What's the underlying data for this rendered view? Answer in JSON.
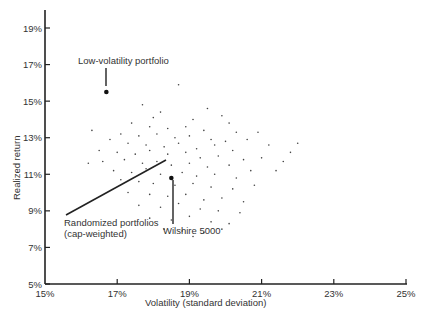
{
  "chart_data": {
    "type": "scatter",
    "title": "",
    "xlabel": "Volatility (standard deviation)",
    "ylabel": "Realized return",
    "xlim": [
      15,
      25
    ],
    "ylim": [
      5,
      20
    ],
    "x_ticks": [
      "15%",
      "17%",
      "19%",
      "21%",
      "23%",
      "25%"
    ],
    "x_tick_values": [
      15,
      17,
      19,
      21,
      23,
      25
    ],
    "y_ticks": [
      "5%",
      "7%",
      "9%",
      "11%",
      "13%",
      "15%",
      "17%",
      "19%"
    ],
    "y_tick_values": [
      5,
      7,
      9,
      11,
      13,
      15,
      17,
      19
    ],
    "grid": false,
    "legend": null,
    "series": [
      {
        "name": "Randomized portfolios (cap-weighted)",
        "marker": "small-dot",
        "points": [
          [
            18.7,
            15.9
          ],
          [
            17.7,
            14.8
          ],
          [
            18.2,
            14.4
          ],
          [
            19.5,
            14.6
          ],
          [
            19.9,
            14.2
          ],
          [
            18.0,
            14.1
          ],
          [
            19.1,
            14.0
          ],
          [
            20.1,
            13.8
          ],
          [
            17.4,
            13.8
          ],
          [
            17.9,
            13.6
          ],
          [
            18.4,
            13.5
          ],
          [
            18.9,
            13.6
          ],
          [
            19.4,
            13.4
          ],
          [
            20.3,
            13.3
          ],
          [
            20.9,
            13.3
          ],
          [
            17.1,
            13.2
          ],
          [
            17.6,
            13.1
          ],
          [
            18.1,
            13.2
          ],
          [
            18.6,
            13.0
          ],
          [
            19.0,
            13.1
          ],
          [
            19.6,
            12.9
          ],
          [
            20.0,
            12.8
          ],
          [
            20.6,
            12.9
          ],
          [
            21.2,
            12.6
          ],
          [
            16.8,
            12.9
          ],
          [
            17.3,
            12.7
          ],
          [
            17.8,
            12.6
          ],
          [
            18.3,
            12.5
          ],
          [
            18.7,
            12.7
          ],
          [
            19.2,
            12.4
          ],
          [
            19.7,
            12.6
          ],
          [
            20.2,
            12.3
          ],
          [
            16.5,
            12.3
          ],
          [
            17.0,
            12.2
          ],
          [
            17.5,
            12.1
          ],
          [
            17.9,
            12.3
          ],
          [
            18.4,
            12.1
          ],
          [
            18.9,
            12.2
          ],
          [
            19.3,
            11.9
          ],
          [
            19.8,
            12.0
          ],
          [
            20.5,
            11.8
          ],
          [
            21.0,
            11.9
          ],
          [
            21.6,
            11.7
          ],
          [
            16.6,
            11.7
          ],
          [
            17.2,
            11.8
          ],
          [
            17.7,
            11.6
          ],
          [
            18.1,
            11.7
          ],
          [
            18.5,
            11.5
          ],
          [
            19.0,
            11.6
          ],
          [
            19.5,
            11.4
          ],
          [
            20.1,
            11.5
          ],
          [
            20.7,
            11.2
          ],
          [
            16.9,
            11.2
          ],
          [
            17.4,
            11.1
          ],
          [
            17.8,
            11.3
          ],
          [
            18.2,
            11.0
          ],
          [
            18.8,
            11.1
          ],
          [
            19.2,
            10.9
          ],
          [
            19.7,
            11.0
          ],
          [
            20.3,
            10.8
          ],
          [
            17.1,
            10.7
          ],
          [
            17.6,
            10.6
          ],
          [
            18.0,
            10.5
          ],
          [
            18.6,
            10.4
          ],
          [
            19.1,
            10.5
          ],
          [
            19.6,
            10.3
          ],
          [
            20.2,
            10.2
          ],
          [
            20.8,
            10.4
          ],
          [
            17.3,
            10.0
          ],
          [
            17.9,
            9.9
          ],
          [
            18.4,
            9.8
          ],
          [
            18.9,
            9.9
          ],
          [
            19.4,
            9.6
          ],
          [
            19.9,
            9.7
          ],
          [
            20.5,
            9.5
          ],
          [
            17.6,
            9.3
          ],
          [
            18.2,
            9.2
          ],
          [
            18.7,
            9.4
          ],
          [
            19.3,
            9.1
          ],
          [
            19.8,
            9.0
          ],
          [
            20.4,
            8.9
          ],
          [
            17.9,
            8.6
          ],
          [
            18.5,
            8.5
          ],
          [
            19.0,
            8.7
          ],
          [
            19.6,
            8.4
          ],
          [
            20.1,
            8.3
          ],
          [
            18.3,
            8.0
          ],
          [
            18.8,
            7.9
          ],
          [
            19.4,
            7.8
          ],
          [
            19.9,
            8.0
          ],
          [
            19.1,
            7.6
          ],
          [
            16.3,
            13.4
          ],
          [
            21.8,
            12.2
          ],
          [
            21.4,
            11.2
          ],
          [
            16.2,
            11.6
          ],
          [
            22.0,
            12.7
          ]
        ]
      },
      {
        "name": "Low-volatility portfolio",
        "marker": "large-dot",
        "points": [
          [
            16.7,
            15.5
          ]
        ]
      },
      {
        "name": "Wilshire 5000",
        "marker": "large-dot",
        "points": [
          [
            18.5,
            10.8
          ]
        ]
      }
    ],
    "annotations": [
      {
        "text": "Low-volatility portfolio",
        "target": [
          16.7,
          15.5
        ],
        "label_pos": [
          16.0,
          17.4
        ]
      },
      {
        "text": "Randomized portfolios",
        "text2": "(cap-weighted)",
        "target": [
          18.3,
          12.2
        ],
        "label_pos": [
          15.6,
          9.2
        ]
      },
      {
        "text": "Wilshire 5000",
        "target": [
          18.5,
          10.8
        ],
        "label_pos": [
          18.1,
          7.6
        ]
      }
    ]
  },
  "labels": {
    "low_vol": "Low-volatility portfolio",
    "random_1": "Randomized portfolios",
    "random_2": "(cap-weighted)",
    "wilshire": "Wilshire 5000",
    "xlabel": "Volatility (standard deviation)",
    "ylabel": "Realized return"
  }
}
